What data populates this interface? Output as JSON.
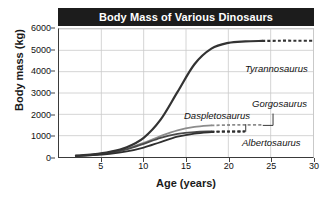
{
  "chart_data": {
    "type": "line",
    "title": "Body Mass of Various Dinosaurs",
    "xlabel": "Age (years)",
    "ylabel": "Body mass (kg)",
    "xlim": [
      0,
      30
    ],
    "ylim": [
      0,
      6000
    ],
    "xticks": [
      5,
      10,
      15,
      20,
      25,
      30
    ],
    "yticks": [
      0,
      1000,
      2000,
      3000,
      4000,
      5000,
      6000
    ],
    "grid": true,
    "legend_position": "inline-annotations",
    "series": [
      {
        "name": "Tyrannosaurus",
        "color": "#333333",
        "width": 2.2,
        "asymptote": 5400,
        "solid_x": [
          2,
          4,
          6,
          8,
          10,
          12,
          14,
          16,
          18,
          20,
          22,
          24
        ],
        "solid_y": [
          60,
          120,
          240,
          460,
          900,
          1750,
          3050,
          4350,
          5080,
          5350,
          5420,
          5440
        ],
        "dashed_x": [
          24,
          26,
          28,
          30
        ],
        "dashed_y": [
          5440,
          5450,
          5450,
          5450
        ]
      },
      {
        "name": "Gorgosaurus",
        "color": "#8c8c8c",
        "width": 1.8,
        "asymptote": 1500,
        "solid_x": [
          2,
          4,
          6,
          8,
          10,
          12,
          14,
          16,
          18
        ],
        "solid_y": [
          60,
          110,
          210,
          390,
          660,
          980,
          1250,
          1410,
          1480
        ],
        "dashed_x": [
          18,
          20,
          22,
          24
        ],
        "dashed_y": [
          1480,
          1500,
          1505,
          1505
        ]
      },
      {
        "name": "Daspletosaurus",
        "color": "#4a4a4a",
        "width": 1.8,
        "asymptote": 1200,
        "solid_x": [
          2,
          4,
          6,
          8,
          10,
          12,
          14,
          16,
          18
        ],
        "solid_y": [
          55,
          100,
          190,
          360,
          620,
          900,
          1080,
          1170,
          1200
        ],
        "dashed_x": [
          18,
          20,
          22
        ],
        "dashed_y": [
          1200,
          1210,
          1215
        ]
      },
      {
        "name": "Albertosaurus",
        "color": "#2f2f2f",
        "width": 1.8,
        "asymptote": 1180,
        "solid_x": [
          2,
          4,
          6,
          8,
          10,
          12,
          14,
          16,
          18
        ],
        "solid_y": [
          50,
          85,
          150,
          260,
          440,
          700,
          950,
          1100,
          1170
        ],
        "dashed_x": [
          18,
          20,
          22
        ],
        "dashed_y": [
          1170,
          1180,
          1185
        ]
      }
    ],
    "annotations": [
      {
        "text": "Tyrannosaurus",
        "x_px": 245,
        "y_px": 63
      },
      {
        "text": "Gorgosaurus",
        "x_px": 252,
        "y_px": 98
      },
      {
        "text": "Daspletosaurus",
        "x_px": 184,
        "y_px": 110
      },
      {
        "text": "Albertosaurus",
        "x_px": 242,
        "y_px": 137
      }
    ]
  },
  "colors": {
    "title_bar_bg": "#1c1c1c",
    "title_bar_text": "#ffffff",
    "grid": "#c9c9c9",
    "axis": "#3a3a3a",
    "background": "#ffffff"
  }
}
